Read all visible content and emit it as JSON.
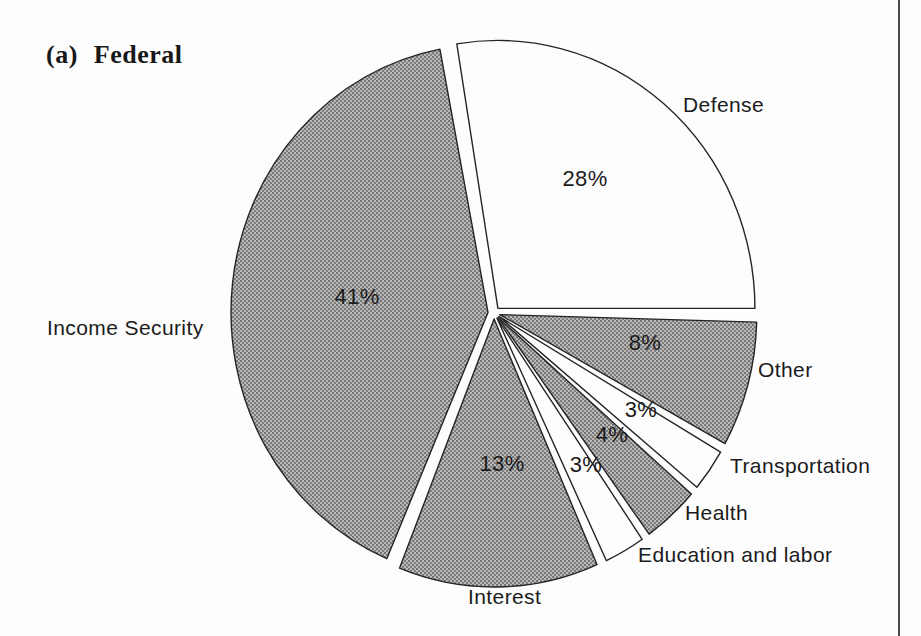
{
  "chart_data": {
    "type": "pie",
    "title": "(a) Federal",
    "direction": "clockwise",
    "start_angle_deg": -10,
    "legend_position": "none",
    "slices": [
      {
        "label": "Defense",
        "value": 28,
        "pct": "28%",
        "fill": "white"
      },
      {
        "label": "Other",
        "value": 8,
        "pct": "8%",
        "fill": "gray"
      },
      {
        "label": "Transportation",
        "value": 3,
        "pct": "3%",
        "fill": "white"
      },
      {
        "label": "Health",
        "value": 4,
        "pct": "4%",
        "fill": "gray"
      },
      {
        "label": "Education and labor",
        "value": 3,
        "pct": "3%",
        "fill": "white"
      },
      {
        "label": "Interest",
        "value": 13,
        "pct": "13%",
        "fill": "gray"
      },
      {
        "label": "Income Security",
        "value": 41,
        "pct": "41%",
        "fill": "gray"
      }
    ],
    "colors": {
      "white_fill": "#fdfdfd",
      "gray_fill_average": "#9a9a9a",
      "outline": "#242424"
    }
  }
}
